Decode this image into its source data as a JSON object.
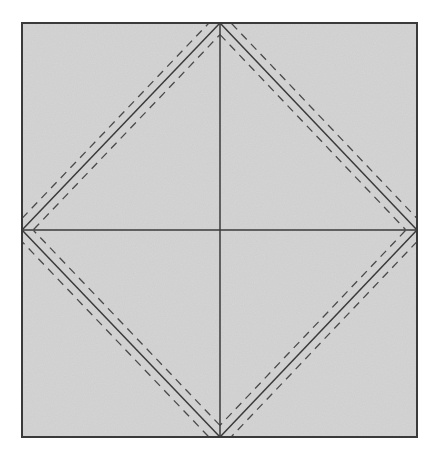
{
  "diagram": {
    "canvas": {
      "width": 437,
      "height": 458,
      "background": "#ffffff"
    },
    "square": {
      "x1": 22,
      "y1": 23,
      "x2": 417,
      "y2": 437,
      "fill": "#d6d6d6",
      "stroke": "#3a3a3a",
      "stroke_width": 2
    },
    "center": {
      "x": 220,
      "y": 230
    },
    "center_lines": [
      {
        "name": "vertical-center-line",
        "x1": 220,
        "y1": 23,
        "x2": 220,
        "y2": 437
      },
      {
        "name": "horizontal-center-line",
        "x1": 22,
        "y1": 230,
        "x2": 417,
        "y2": 230
      }
    ],
    "diamond": {
      "vertices": [
        [
          220,
          23
        ],
        [
          417,
          230
        ],
        [
          220,
          437
        ],
        [
          22,
          230
        ]
      ],
      "stroke": "#3a3a3a",
      "stroke_width": 1.5
    },
    "dashed_offset": 8,
    "dash_pattern": "8,6",
    "line_color": "#3a3a3a",
    "dash_color": "#4a4a4a"
  }
}
